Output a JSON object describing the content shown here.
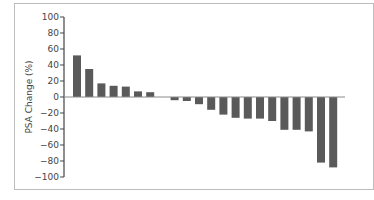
{
  "chart_data": {
    "type": "bar",
    "title": "",
    "xlabel": "",
    "ylabel": "PSA Change (%)",
    "ylim": [
      -100,
      100
    ],
    "yticks": [
      100,
      80,
      60,
      40,
      20,
      0,
      -20,
      -40,
      -60,
      -80,
      -100
    ],
    "grid": false,
    "legend": null,
    "categories": [
      "1",
      "2",
      "3",
      "4",
      "5",
      "6",
      "7",
      "8",
      "9",
      "10",
      "11",
      "12",
      "13",
      "14",
      "15",
      "16",
      "17",
      "18",
      "19",
      "20",
      "21",
      "22"
    ],
    "values": [
      52,
      35,
      17,
      14,
      13,
      7,
      6,
      0,
      -4,
      -5,
      -9,
      -16,
      -22,
      -26,
      -27,
      -27,
      -30,
      -41,
      -41,
      -43,
      -82,
      -88
    ],
    "bar_color": "#5a5a5a",
    "axis_color": "#444444"
  }
}
